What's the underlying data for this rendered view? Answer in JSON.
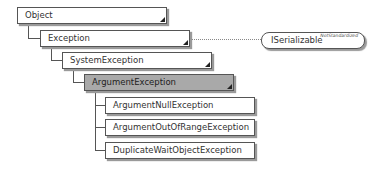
{
  "diagram": {
    "nodes": [
      {
        "id": "object",
        "label": "Object",
        "kind": "class"
      },
      {
        "id": "exception",
        "label": "Exception",
        "kind": "class"
      },
      {
        "id": "system-exception",
        "label": "SystemException",
        "kind": "class"
      },
      {
        "id": "argument-exception",
        "label": "ArgumentException",
        "kind": "class",
        "highlighted": true
      },
      {
        "id": "argument-null-exception",
        "label": "ArgumentNullException",
        "kind": "class"
      },
      {
        "id": "argument-out-of-range-exception",
        "label": "ArgumentOutOfRangeException",
        "kind": "class"
      },
      {
        "id": "duplicate-wait-object-exception",
        "label": "DuplicateWaitObjectException",
        "kind": "class"
      }
    ],
    "interface": {
      "label": "ISerializable",
      "annotation": "NotStandardized",
      "implemented_by": "exception"
    },
    "edges": [
      {
        "from": "exception",
        "to": "object",
        "type": "inherits"
      },
      {
        "from": "system-exception",
        "to": "exception",
        "type": "inherits"
      },
      {
        "from": "argument-exception",
        "to": "system-exception",
        "type": "inherits"
      },
      {
        "from": "argument-null-exception",
        "to": "argument-exception",
        "type": "inherits"
      },
      {
        "from": "argument-out-of-range-exception",
        "to": "argument-exception",
        "type": "inherits"
      },
      {
        "from": "duplicate-wait-object-exception",
        "to": "argument-exception",
        "type": "inherits"
      },
      {
        "from": "exception",
        "to": "iserializable",
        "type": "implements"
      }
    ],
    "colors": {
      "border": "#555555",
      "highlight_fill": "#a9a9a9",
      "shadow": "#9a9a9a"
    }
  }
}
